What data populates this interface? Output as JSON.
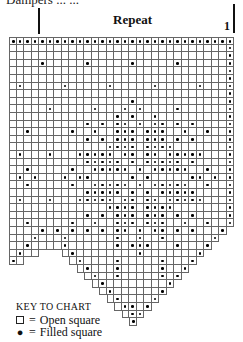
{
  "header": {
    "cut_title": "Dampers ... ...",
    "repeat_label": "Repeat",
    "repeat_number": "1"
  },
  "grid": {
    "columns": 30,
    "cell_width": 7.5,
    "cell_height": 7.6,
    "rows": [
      {
        "start": 0,
        "end": 29,
        "filled": [
          0,
          1,
          2,
          3,
          4,
          5,
          6,
          7,
          8,
          9,
          10,
          11,
          12,
          13,
          14,
          15,
          16,
          17,
          18,
          19,
          20,
          21,
          22,
          23,
          24,
          25,
          26,
          27,
          28,
          29
        ]
      },
      {
        "start": 0,
        "end": 29,
        "filled": [
          29
        ]
      },
      {
        "start": 0,
        "end": 29,
        "filled": [
          29
        ]
      },
      {
        "start": 0,
        "end": 29,
        "filled": [
          4,
          10,
          16,
          22,
          29
        ]
      },
      {
        "start": 0,
        "end": 29,
        "filled": [
          29
        ]
      },
      {
        "start": 0,
        "end": 29,
        "filled": [
          29
        ]
      },
      {
        "start": 0,
        "end": 29,
        "filled": [
          1,
          7,
          13,
          19,
          25,
          29
        ]
      },
      {
        "start": 0,
        "end": 29,
        "filled": [
          29
        ]
      },
      {
        "start": 0,
        "end": 29,
        "filled": [
          16,
          29
        ]
      },
      {
        "start": 0,
        "end": 29,
        "filled": [
          5,
          11,
          15,
          17,
          22,
          29
        ]
      },
      {
        "start": 0,
        "end": 29,
        "filled": [
          14,
          16,
          19,
          29
        ]
      },
      {
        "start": 0,
        "end": 29,
        "filled": [
          10,
          12,
          14,
          15,
          17,
          19,
          20,
          22,
          24,
          29
        ]
      },
      {
        "start": 0,
        "end": 29,
        "filled": [
          2,
          8,
          11,
          14,
          15,
          16,
          18,
          19,
          20,
          23,
          26,
          29
        ]
      },
      {
        "start": 0,
        "end": 29,
        "filled": [
          10,
          12,
          14,
          15,
          16,
          18,
          19,
          20,
          22,
          24,
          29
        ]
      },
      {
        "start": 0,
        "end": 29,
        "filled": [
          13,
          14,
          15,
          16,
          18,
          19,
          20,
          21,
          29
        ]
      },
      {
        "start": 0,
        "end": 29,
        "filled": [
          1,
          5,
          9,
          10,
          11,
          12,
          13,
          15,
          16,
          18,
          19,
          21,
          22,
          23,
          24,
          25,
          29
        ]
      },
      {
        "start": 0,
        "end": 29,
        "filled": [
          10,
          11,
          12,
          13,
          14,
          16,
          18,
          19,
          20,
          21,
          22,
          24,
          29
        ]
      },
      {
        "start": 0,
        "end": 29,
        "filled": [
          2,
          8,
          11,
          12,
          13,
          14,
          15,
          17,
          19,
          20,
          21,
          22,
          23,
          26,
          29
        ]
      },
      {
        "start": 0,
        "end": 29,
        "filled": [
          1,
          3,
          7,
          9,
          10,
          16,
          18,
          24,
          25,
          27,
          29
        ]
      },
      {
        "start": 0,
        "end": 29,
        "filled": [
          2,
          8,
          11,
          12,
          13,
          14,
          15,
          17,
          19,
          20,
          21,
          22,
          23,
          26,
          29
        ]
      },
      {
        "start": 0,
        "end": 29,
        "filled": [
          10,
          11,
          12,
          13,
          14,
          16,
          18,
          20,
          21,
          22,
          23,
          24,
          29
        ]
      },
      {
        "start": 0,
        "end": 29,
        "filled": [
          1,
          5,
          9,
          10,
          11,
          12,
          13,
          15,
          16,
          18,
          19,
          21,
          22,
          23,
          24,
          25,
          29
        ]
      },
      {
        "start": 0,
        "end": 29,
        "filled": [
          13,
          14,
          15,
          16,
          18,
          19,
          20,
          21,
          29
        ]
      },
      {
        "start": 0,
        "end": 29,
        "filled": [
          10,
          12,
          14,
          15,
          16,
          18,
          19,
          20,
          22,
          24,
          29
        ]
      },
      {
        "start": 0,
        "end": 29,
        "filled": [
          2,
          8,
          11,
          14,
          15,
          16,
          18,
          19,
          20,
          23,
          26,
          29
        ]
      },
      {
        "start": 0,
        "end": 28,
        "filled": [
          4,
          6,
          8,
          10,
          12,
          14,
          15,
          17,
          19,
          20,
          22,
          24,
          28
        ]
      },
      {
        "start": 0,
        "end": 27,
        "filled": [
          3,
          7,
          14,
          17,
          20,
          27
        ]
      },
      {
        "start": 0,
        "end": 26,
        "filled": [
          2,
          7,
          14,
          16,
          17,
          18,
          22,
          26
        ]
      },
      {
        "start": 0,
        "end": 3,
        "filled": [
          1
        ],
        "start2": 7,
        "end2": 25,
        "filled2": [
          8,
          17,
          25
        ]
      },
      {
        "start": 0,
        "end": 1,
        "filled": [
          0
        ],
        "start2": 8,
        "end2": 24,
        "filled2": [
          9,
          14,
          20,
          24
        ]
      },
      {
        "start2": 9,
        "end2": 23,
        "filled2": [
          10,
          14,
          20,
          23
        ]
      },
      {
        "start2": 10,
        "end2": 22,
        "filled2": [
          11,
          14,
          20,
          22
        ]
      },
      {
        "start2": 11,
        "end2": 21,
        "filled2": [
          12,
          21
        ]
      },
      {
        "start2": 12,
        "end2": 20,
        "filled2": [
          13,
          20
        ]
      },
      {
        "start2": 13,
        "end2": 19,
        "filled2": [
          14,
          19
        ]
      },
      {
        "start2": 14,
        "end2": 18,
        "filled2": [
          15,
          16,
          18
        ]
      },
      {
        "start2": 15,
        "end2": 17,
        "filled2": [
          16,
          17
        ]
      },
      {
        "start2": 16,
        "end2": 16,
        "filled2": [
          16
        ]
      }
    ]
  },
  "key": {
    "title": "KEY TO CHART",
    "open_symbol": "open-square",
    "open_label": "Open square",
    "filled_symbol": "filled-dot",
    "filled_label": "Filled square",
    "equals": "="
  },
  "colors": {
    "grid_line": "#666666",
    "dot": "#000000",
    "background": "#ffffff"
  }
}
